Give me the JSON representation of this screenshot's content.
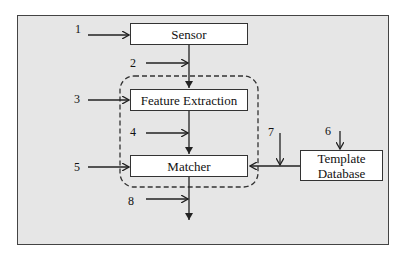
{
  "diagram": {
    "blocks": {
      "sensor": "Sensor",
      "feature_extraction": "Feature Extraction",
      "matcher": "Matcher",
      "template_database_line1": "Template",
      "template_database_line2": "Database"
    },
    "attack_points": [
      "1",
      "2",
      "3",
      "4",
      "5",
      "6",
      "7",
      "8"
    ],
    "colors": {
      "frame_bg": "#e6e6e6",
      "box_bg": "#ffffff",
      "line": "#222222"
    }
  }
}
